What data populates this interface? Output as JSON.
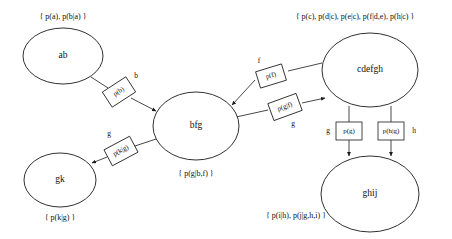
{
  "diagram": {
    "type": "junction-tree-clique-graph",
    "title_text": "",
    "colors": {
      "stroke": "#1a1a1a",
      "fill": "#ffffff",
      "text": "#101010"
    },
    "cliques": [
      {
        "id": "ab",
        "label": "ab",
        "cx": 63,
        "cy": 56,
        "rx": 40,
        "ry": 28,
        "potential": "{ p(a), p(b|a) }",
        "potential_x": 63,
        "potential_y": 17,
        "potential_anchor": "middle"
      },
      {
        "id": "bfg",
        "label": "bfg",
        "cx": 196,
        "cy": 126,
        "rx": 43,
        "ry": 34,
        "potential": "{ p(g|b,f) }",
        "potential_x": 196,
        "potential_y": 174,
        "potential_anchor": "middle"
      },
      {
        "id": "gk",
        "label": "gk",
        "cx": 60,
        "cy": 180,
        "rx": 36,
        "ry": 27,
        "potential": "{ p(k|g) }",
        "potential_x": 60,
        "potential_y": 218,
        "potential_anchor": "middle"
      },
      {
        "id": "cdefgh",
        "label": "cdefgh",
        "cx": 370,
        "cy": 70,
        "rx": 48,
        "ry": 37,
        "potential": "{ p(c), p(d|c), p(e|c), p(f|d,e), p(h|c) }",
        "potential_x": 355,
        "potential_y": 17,
        "potential_anchor": "middle"
      },
      {
        "id": "ghij",
        "label": "ghij",
        "cx": 370,
        "cy": 194,
        "rx": 49,
        "ry": 38,
        "potential": "{ p(i|h), p(j|g,h,i) }",
        "potential_x": 296,
        "potential_y": 216,
        "potential_anchor": "middle"
      }
    ],
    "separators": [
      {
        "id": "sep-b",
        "factor_text": "p(b)",
        "letter": "b",
        "cx": 119,
        "cy": 92,
        "w": 28,
        "h": 18,
        "rotate": -33,
        "letter_x": 136,
        "letter_y": 76
      },
      {
        "id": "sep-g-gk",
        "factor_text": "p(k|g)",
        "letter": "g",
        "cx": 121,
        "cy": 151,
        "w": 29,
        "h": 18,
        "rotate": -28,
        "letter_x": 109,
        "letter_y": 134
      },
      {
        "id": "sep-f",
        "factor_text": "p(f)",
        "letter": "f",
        "cx": 271,
        "cy": 76,
        "w": 27,
        "h": 17,
        "rotate": -17,
        "letter_x": 259,
        "letter_y": 61
      },
      {
        "id": "sep-g-bfg",
        "factor_text": "p(g|f)",
        "letter": "g",
        "cx": 285,
        "cy": 107,
        "w": 30,
        "h": 18,
        "rotate": -20,
        "letter_x": 293,
        "letter_y": 124
      },
      {
        "id": "sep-g-ghij",
        "factor_text": "p(g)",
        "letter": "g",
        "cx": 349,
        "cy": 131,
        "w": 26,
        "h": 18,
        "rotate": 0,
        "letter_x": 328,
        "letter_y": 131
      },
      {
        "id": "sep-h",
        "factor_text": "p(h|g)",
        "letter": "h",
        "cx": 391,
        "cy": 131,
        "w": 26,
        "h": 18,
        "rotate": 0,
        "letter_x": 414,
        "letter_y": 131
      }
    ],
    "edges": [
      {
        "id": "edge-ab-sep-b",
        "from": "ab",
        "to": "sep-b",
        "d": "M 91,77 L 108,88",
        "arrow": false
      },
      {
        "id": "edge-sep-b-bfg",
        "from": "sep-b",
        "to": "bfg",
        "d": "M 131,98 L 156,111",
        "arrow": true
      },
      {
        "id": "edge-bfg-sep-g-gk",
        "from": "bfg",
        "to": "sep-g-gk",
        "d": "M 159,138 L 135,146",
        "arrow": false
      },
      {
        "id": "edge-sep-g-gk-gk",
        "from": "sep-g-gk",
        "to": "gk",
        "d": "M 107,157 L 92,163",
        "arrow": true
      },
      {
        "id": "edge-cdefgh-sep-f",
        "from": "cdefgh",
        "to": "sep-f",
        "d": "M 322,63 L 288,71",
        "arrow": false
      },
      {
        "id": "edge-sep-f-bfg",
        "from": "sep-f",
        "to": "bfg",
        "d": "M 255,80 L 232,105",
        "arrow": true
      },
      {
        "id": "edge-bfg-sep-g-bfg",
        "from": "bfg",
        "to": "sep-g-bfg",
        "d": "M 236,117 L 268,110",
        "arrow": false
      },
      {
        "id": "edge-sep-g-bfg-cdefgh",
        "from": "sep-g-bfg",
        "to": "cdefgh",
        "d": "M 302,103 L 325,98",
        "arrow": true
      },
      {
        "id": "edge-cdefgh-sep-g",
        "from": "cdefgh",
        "to": "sep-g-ghij",
        "d": "M 349,106 L 349,122",
        "arrow": false
      },
      {
        "id": "edge-sep-g-ghij",
        "from": "sep-g-ghij",
        "to": "ghij",
        "d": "M 349,140 L 349,156",
        "arrow": true
      },
      {
        "id": "edge-cdefgh-sep-h",
        "from": "cdefgh",
        "to": "sep-h",
        "d": "M 391,106 L 391,122",
        "arrow": false
      },
      {
        "id": "edge-sep-h-ghij",
        "from": "sep-h",
        "to": "ghij",
        "d": "M 391,140 L 391,156",
        "arrow": true
      }
    ]
  }
}
